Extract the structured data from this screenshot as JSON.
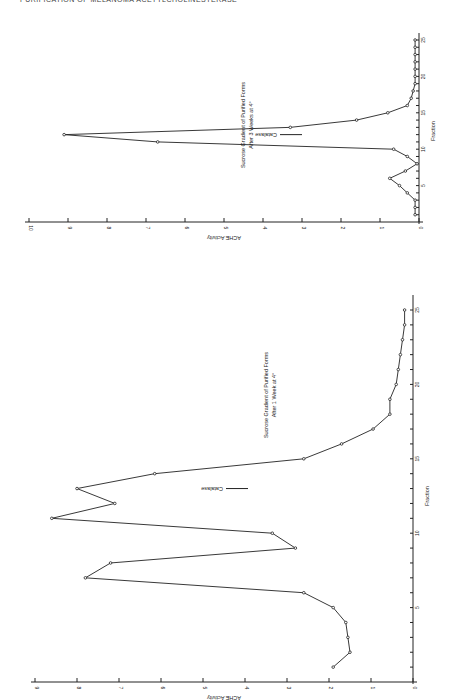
{
  "page": {
    "header": "PURIFICATION OF MELANOMA ACETYLCHOLINESTERASE"
  },
  "chart_data": [
    {
      "type": "line",
      "id": "three-weeks",
      "title": "Sucrose Gradient of Purified Forms",
      "subtitle": "After 3 Weeks at 4°",
      "xlabel": "Fraction",
      "ylabel": "ACHE Activity",
      "xlim": [
        0,
        25
      ],
      "ylim": [
        0,
        10
      ],
      "xticks": [
        0,
        5,
        10,
        15,
        20,
        25
      ],
      "yticks": [
        0,
        1,
        2,
        3,
        4,
        5,
        6,
        7,
        8,
        9,
        10
      ],
      "grid": false,
      "annotation": {
        "text": "Catalase",
        "fraction": 12
      },
      "orientation": "rotated-90",
      "series": [
        {
          "name": "ACHE Activity",
          "x": [
            1,
            2,
            3,
            4,
            5,
            6,
            7,
            8,
            9,
            10,
            11,
            12,
            13,
            14,
            15,
            16,
            17,
            18,
            19,
            20,
            21,
            22,
            23,
            24,
            25
          ],
          "values": [
            0.1,
            0.1,
            0.1,
            0.3,
            0.5,
            0.75,
            0.35,
            0.05,
            0.3,
            0.65,
            6.7,
            9.1,
            3.3,
            1.6,
            0.8,
            0.3,
            0.2,
            0.15,
            0.1,
            0.1,
            0.1,
            0.1,
            0.1,
            0.1,
            0.1
          ]
        }
      ]
    },
    {
      "type": "line",
      "id": "one-week",
      "title": "Sucrose Gradient of Purified Forms",
      "subtitle": "After 1 Week at 4°",
      "xlabel": "Fraction",
      "ylabel": "ACHE Activity",
      "xlim": [
        0,
        25
      ],
      "ylim": [
        0,
        9
      ],
      "xticks": [
        0,
        5,
        10,
        15,
        20,
        25
      ],
      "yticks": [
        0,
        1,
        2,
        3,
        4,
        5,
        6,
        7,
        8,
        9
      ],
      "grid": false,
      "annotation": {
        "text": "Catalase",
        "fraction": 13
      },
      "orientation": "rotated-90",
      "series": [
        {
          "name": "ACHE Activity",
          "x": [
            1,
            2,
            3,
            4,
            5,
            6,
            7,
            8,
            9,
            10,
            11,
            12,
            13,
            14,
            15,
            16,
            17,
            18,
            19,
            20,
            21,
            22,
            23,
            24,
            25
          ],
          "values": [
            1.9,
            1.5,
            1.55,
            1.6,
            1.9,
            2.6,
            7.8,
            7.2,
            2.8,
            3.35,
            8.6,
            7.1,
            8.0,
            6.15,
            2.6,
            1.7,
            0.95,
            0.55,
            0.55,
            0.4,
            0.35,
            0.3,
            0.25,
            0.2,
            0.2
          ]
        }
      ]
    }
  ]
}
